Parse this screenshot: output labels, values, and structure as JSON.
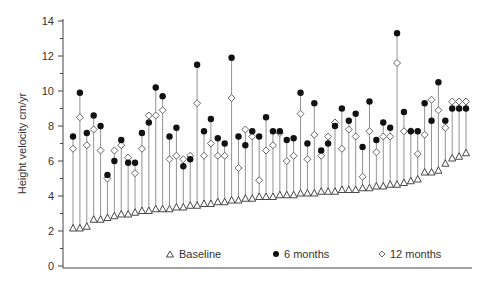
{
  "chart_data": {
    "type": "scatter",
    "title": "",
    "xlabel": "",
    "ylabel": "Height velocity cm/yr",
    "ylim": [
      0,
      14
    ],
    "yticks": [
      0,
      2,
      4,
      6,
      8,
      10,
      12,
      14
    ],
    "grid": false,
    "legend_position": "bottom-inside",
    "legend": [
      {
        "name": "Baseline",
        "marker": "triangle-open"
      },
      {
        "name": "6 months",
        "marker": "circle-filled"
      },
      {
        "name": "12 months",
        "marker": "diamond-open"
      }
    ],
    "note": "Each vertical line is one patient, sorted by baseline height velocity; line spans from baseline to max value.",
    "series": [
      {
        "name": "Baseline",
        "values": [
          2.2,
          2.2,
          2.3,
          2.7,
          2.7,
          2.8,
          2.9,
          3.0,
          3.0,
          3.1,
          3.2,
          3.2,
          3.3,
          3.3,
          3.3,
          3.4,
          3.4,
          3.5,
          3.5,
          3.6,
          3.6,
          3.7,
          3.7,
          3.8,
          3.8,
          3.9,
          3.9,
          4.0,
          4.0,
          4.0,
          4.1,
          4.1,
          4.1,
          4.2,
          4.2,
          4.2,
          4.3,
          4.3,
          4.3,
          4.4,
          4.4,
          4.4,
          4.5,
          4.5,
          4.6,
          4.6,
          4.7,
          4.7,
          4.8,
          4.9,
          5.0,
          5.4,
          5.4,
          5.5,
          5.9,
          6.2,
          6.3,
          6.5
        ]
      },
      {
        "name": "6 months",
        "values": [
          7.4,
          9.9,
          7.6,
          8.6,
          8.0,
          5.2,
          6.0,
          7.2,
          5.9,
          5.9,
          7.6,
          8.2,
          10.2,
          9.7,
          7.4,
          7.9,
          5.7,
          6.1,
          11.5,
          7.7,
          8.4,
          7.3,
          7.0,
          11.9,
          7.4,
          6.9,
          7.7,
          7.4,
          8.5,
          7.7,
          7.7,
          7.2,
          7.3,
          9.9,
          7.0,
          9.3,
          6.6,
          7.0,
          8.0,
          9.0,
          8.3,
          8.7,
          6.8,
          9.4,
          7.2,
          8.2,
          7.9,
          13.3,
          8.8,
          7.7,
          7.7,
          9.3,
          8.3,
          10.5,
          8.3,
          9.0,
          9.0,
          9.0
        ]
      },
      {
        "name": "12 months",
        "values": [
          6.7,
          8.5,
          6.9,
          7.8,
          6.6,
          5.0,
          6.6,
          6.9,
          6.2,
          5.3,
          6.7,
          8.6,
          8.6,
          8.9,
          6.1,
          6.3,
          6.1,
          6.3,
          9.3,
          6.3,
          7.0,
          6.3,
          6.3,
          9.6,
          5.6,
          7.8,
          7.4,
          4.9,
          6.6,
          6.9,
          7.6,
          6.0,
          6.3,
          8.7,
          6.1,
          7.5,
          6.3,
          7.4,
          8.2,
          6.7,
          7.8,
          7.4,
          5.1,
          7.7,
          6.5,
          7.4,
          7.4,
          11.6,
          7.7,
          7.7,
          6.4,
          7.5,
          9.5,
          8.9,
          7.9,
          9.4,
          9.4,
          9.4
        ]
      }
    ]
  },
  "axis": {
    "ylabel": "Height velocity cm/yr",
    "ytick_labels": [
      "0",
      "2",
      "4",
      "6",
      "8",
      "10",
      "12",
      "14"
    ]
  },
  "legend": {
    "baseline_label": "Baseline",
    "six_months_label": "6 months",
    "twelve_months_label": "12 months"
  }
}
